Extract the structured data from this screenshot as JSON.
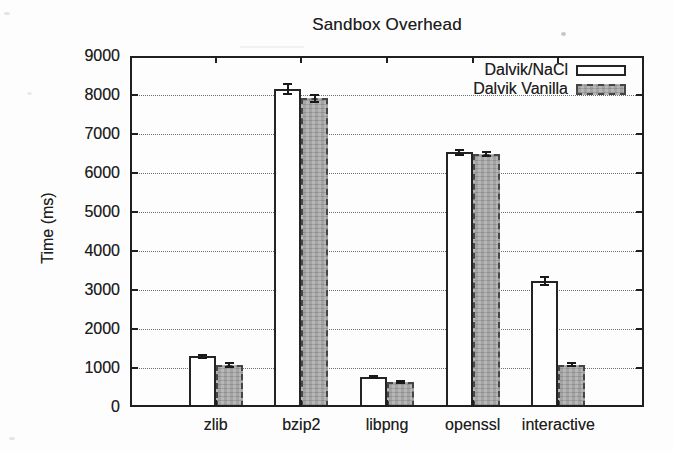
{
  "figure": {
    "title": "Sandbox Overhead",
    "ylabel": "Time (ms)"
  },
  "chart_data": {
    "type": "bar",
    "title": "Sandbox Overhead",
    "xlabel": "",
    "ylabel": "Time (ms)",
    "ylim": [
      0,
      9000
    ],
    "ytick_step": 1000,
    "grid": "horizontal-dotted",
    "legend_position": "top-right-inside",
    "bar_group": "side-by-side-pairs",
    "categories": [
      "zlib",
      "bzip2",
      "libpng",
      "openssl",
      "interactive"
    ],
    "series": [
      {
        "name": "Dalvik/NaCl",
        "fill": "white",
        "values": [
          1300,
          8150,
          770,
          6530,
          3230
        ],
        "errors": [
          40,
          130,
          30,
          60,
          110
        ]
      },
      {
        "name": "Dalvik Vanilla",
        "fill": "hatched-gray",
        "values": [
          1080,
          7920,
          640,
          6490,
          1090
        ],
        "errors": [
          60,
          90,
          30,
          60,
          40
        ]
      }
    ]
  },
  "colors": {
    "background": "#fdfdfd",
    "frame": "#1f1f1f",
    "grid_dotted": "#6e6e6e",
    "bar_white_fill": "#fefefe",
    "bar_gray_fill": "#b7b7b7",
    "text": "#1e1e1e"
  }
}
